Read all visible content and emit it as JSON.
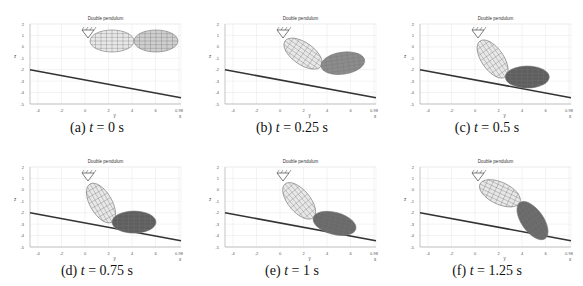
{
  "figure": {
    "plot_title": "Double pendulum",
    "y_axis_label": "z",
    "x_axis_label": "y",
    "x_axis_corner_label": "x",
    "x_ticks": [
      "-4",
      "-2",
      "0",
      "2",
      "4",
      "6",
      "0.98"
    ],
    "y_ticks": [
      "2",
      "1",
      "0",
      "-1",
      "-2",
      "-3",
      "-4",
      "-5"
    ],
    "panels": [
      {
        "id": "a",
        "caption_prefix": "(a)",
        "t_var": "t",
        "equals": "=",
        "t_value": "0 s",
        "link1_angle_deg": 0,
        "link2_angle_deg": 0,
        "link2_shade": "#cfcfcf"
      },
      {
        "id": "b",
        "caption_prefix": "(b)",
        "t_var": "t",
        "equals": "=",
        "t_value": "0.25 s",
        "link1_angle_deg": 35,
        "link2_angle_deg": -8,
        "link2_shade": "#8c8c8c"
      },
      {
        "id": "c",
        "caption_prefix": "(c)",
        "t_var": "t",
        "equals": "=",
        "t_value": "0.5 s",
        "link1_angle_deg": 55,
        "link2_angle_deg": 0,
        "link2_shade": "#5f5f5f"
      },
      {
        "id": "d",
        "caption_prefix": "(d)",
        "t_var": "t",
        "equals": "=",
        "t_value": "0.75 s",
        "link1_angle_deg": 60,
        "link2_angle_deg": 0,
        "link2_shade": "#5f5f5f"
      },
      {
        "id": "e",
        "caption_prefix": "(e)",
        "t_var": "t",
        "equals": "=",
        "t_value": "1 s",
        "link1_angle_deg": 50,
        "link2_angle_deg": 15,
        "link2_shade": "#6a6a6a"
      },
      {
        "id": "f",
        "caption_prefix": "(f)",
        "t_var": "t",
        "equals": "=",
        "t_value": "1.25 s",
        "link1_angle_deg": 25,
        "link2_angle_deg": 55,
        "link2_shade": "#6a6a6a"
      }
    ]
  },
  "colors": {
    "grid": "#e6e6e6",
    "axis": "#999999",
    "slope": "#333333",
    "link1": "#e8e8e8",
    "mesh": "#777777"
  }
}
